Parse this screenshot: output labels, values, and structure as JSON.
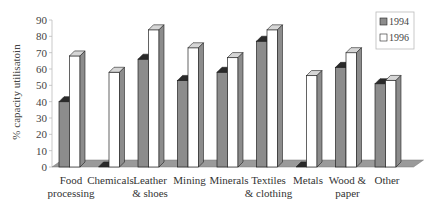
{
  "chart_data": {
    "type": "bar",
    "title": "",
    "xlabel": "",
    "ylabel": "% capacity utilisatoin",
    "ylim": [
      0,
      90
    ],
    "yticks": [
      0,
      10,
      20,
      30,
      40,
      50,
      60,
      70,
      80,
      90
    ],
    "grid": false,
    "legend_position": "top-right",
    "style": "3d-clustered-column",
    "categories": [
      [
        "Food",
        "processing"
      ],
      [
        "Chemicals"
      ],
      [
        "Leather",
        "& shoes"
      ],
      [
        "Mining"
      ],
      [
        "Minerals"
      ],
      [
        "Textiles",
        "& clothing"
      ],
      [
        "Metals"
      ],
      [
        "Wood &",
        "paper"
      ],
      [
        "Other"
      ]
    ],
    "series": [
      {
        "name": "1994",
        "color": "#8c8c8c",
        "values": [
          40,
          0,
          66,
          53,
          58,
          77,
          0,
          61,
          51
        ]
      },
      {
        "name": "1996",
        "color": "#ffffff",
        "values": [
          68,
          58,
          84,
          73,
          67,
          84,
          56,
          70,
          53
        ]
      }
    ]
  },
  "legend": {
    "items": [
      {
        "label": "1994",
        "swatch": "#8c8c8c"
      },
      {
        "label": "1996",
        "swatch": "#ffffff"
      }
    ]
  }
}
